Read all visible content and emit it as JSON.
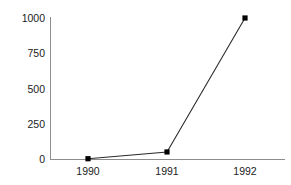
{
  "chart_data": {
    "type": "line",
    "title": "",
    "subtitle": "",
    "xlabel": "",
    "ylabel": "",
    "categories": [
      "1990",
      "1991",
      "1992"
    ],
    "x": [
      1990,
      1991,
      1992
    ],
    "values": [
      2,
      50,
      1000
    ],
    "series": [
      {
        "name": "",
        "values": [
          2,
          50,
          1000
        ]
      }
    ],
    "xtick_labels": [
      "1990",
      "1991",
      "1992"
    ],
    "ytick_labels": [
      "0",
      "250",
      "500",
      "750",
      "1000"
    ],
    "yticks": [
      0,
      250,
      500,
      750,
      1000
    ],
    "ylim": [
      0,
      1000
    ],
    "xlim": [
      1989.5,
      1992.5
    ],
    "grid": false,
    "legend": false,
    "legend_position": "none",
    "annotations": [],
    "marker": "square",
    "colors": {
      "line": "#2b2b2b",
      "marker": "#000000",
      "axis": "#8d8d8d",
      "text": "#1b1b1b",
      "background": "#ffffff"
    }
  },
  "axes": {
    "y_ticks": [
      {
        "label": "1000",
        "value": 1000
      },
      {
        "label": "750",
        "value": 750
      },
      {
        "label": "500",
        "value": 500
      },
      {
        "label": "250",
        "value": 250
      },
      {
        "label": "0",
        "value": 0
      }
    ],
    "x_ticks": [
      {
        "label": "1990",
        "value": 1990
      },
      {
        "label": "1991",
        "value": 1991
      },
      {
        "label": "1992",
        "value": 1992
      }
    ]
  }
}
